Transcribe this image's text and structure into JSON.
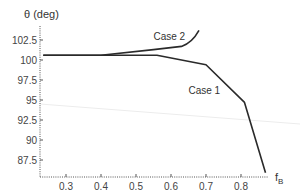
{
  "chart_data": {
    "type": "line",
    "title": "",
    "xlabel": "f_B",
    "xlabel_main": "f",
    "xlabel_sub": "B",
    "ylabel": "θ (deg)",
    "xlim": [
      0.225,
      0.875
    ],
    "ylim": [
      85.5,
      104.5
    ],
    "x_ticks": [
      0.3,
      0.4,
      0.5,
      0.6,
      0.7,
      0.8
    ],
    "x_tick_labels": [
      "0.3",
      "0.4",
      "0.5",
      "0.6",
      "0.7",
      "0.8"
    ],
    "y_ticks": [
      87.5,
      90,
      92.5,
      95,
      97.5,
      100,
      102.5
    ],
    "y_tick_labels": [
      "87.5",
      "90",
      "92.5",
      "95",
      "97.5",
      "100",
      "102.5"
    ],
    "grid": false,
    "legend": "none (inline annotations)",
    "series": [
      {
        "name": "Case 1",
        "x": [
          0.235,
          0.4,
          0.56,
          0.7,
          0.81,
          0.87
        ],
        "values": [
          100.6,
          100.6,
          100.6,
          99.4,
          94.7,
          85.9
        ]
      },
      {
        "name": "Case 2",
        "x": [
          0.235,
          0.4,
          0.55,
          0.63,
          0.66,
          0.68
        ],
        "values": [
          100.6,
          100.6,
          101.3,
          101.7,
          102.5,
          103.7
        ]
      }
    ],
    "annotations": [
      {
        "text": "Case 2",
        "x": 0.55,
        "y": 102.5
      },
      {
        "text": "Case 1",
        "x": 0.65,
        "y": 95.8
      }
    ]
  },
  "colors": {
    "line": "#2a2a2a",
    "axis": "#555555",
    "text": "#444444",
    "artifact": "#e6e6e6"
  }
}
